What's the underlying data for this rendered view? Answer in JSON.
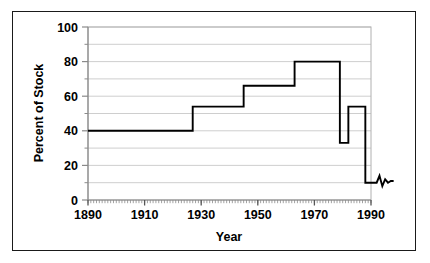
{
  "chart_data": {
    "type": "line",
    "title": "",
    "xlabel": "Year",
    "ylabel": "Percent of Stock",
    "xlim": [
      1890,
      1990
    ],
    "ylim": [
      0,
      100
    ],
    "xticks": [
      1890,
      1910,
      1930,
      1950,
      1970,
      1990
    ],
    "xtick_labels": [
      "1890",
      "1910",
      "1930",
      "1950",
      "1970",
      "1990"
    ],
    "yticks": [
      0,
      20,
      40,
      60,
      80,
      100
    ],
    "ytick_labels": [
      "0",
      "20",
      "40",
      "60",
      "80",
      "100"
    ],
    "minor_ytick_step": 10,
    "grid": true,
    "grid_axis": "y",
    "legend": "none",
    "line_color": "#000000",
    "grid_color": "#c8c8c8",
    "axis_color": "#aaaaaa",
    "series": [
      {
        "name": "Percent of Stock",
        "step_style": "post",
        "x": [
          1890,
          1927,
          1927,
          1945,
          1945,
          1963,
          1963,
          1979,
          1979,
          1982,
          1982,
          1988,
          1988,
          1992,
          1993,
          1994,
          1995,
          1996,
          1997,
          1998
        ],
        "y": [
          40,
          40,
          54,
          54,
          66,
          66,
          80,
          80,
          33,
          33,
          54,
          54,
          10,
          10,
          14,
          8,
          12,
          10,
          11,
          11
        ]
      }
    ],
    "annotations": [
      {
        "text": "flat plateau at 40 percent from 1890 to 1927"
      },
      {
        "text": "step up to 54 percent, 1927 to 1945"
      },
      {
        "text": "step up to 66 percent, 1945 to 1963"
      },
      {
        "text": "step up to 80 percent, 1963 to 1979"
      },
      {
        "text": "sharp drop to 33 percent around 1979"
      },
      {
        "text": "rise back to 54 percent around 1982"
      },
      {
        "text": "steep decline to about 10 percent after 1988 with small oscillation"
      }
    ]
  },
  "axis": {
    "y_title": "Percent of Stock",
    "x_title": "Year"
  }
}
